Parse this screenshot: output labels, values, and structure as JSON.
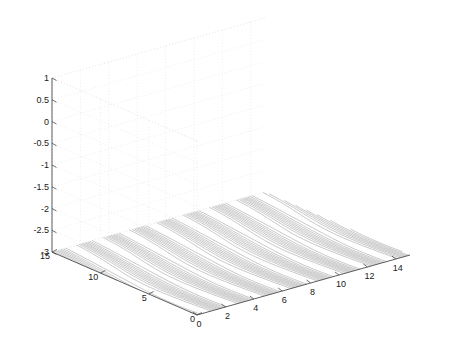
{
  "figure": {
    "background_color": "#ffffff",
    "renderer": "matlab-meshc-3d-surface",
    "width": 455,
    "height": 361
  },
  "chart_data": {
    "type": "surface",
    "title": "",
    "subtitle": "",
    "xlabel": "",
    "ylabel": "",
    "zlabel": "",
    "grid": true,
    "grid_style": "dotted",
    "legend": null,
    "legend_position": "none",
    "projection": "3d-perspective",
    "mesh_style": "wireframe-diamond",
    "mesh_color": "#3a3a3a",
    "contour_color": "#9a9a9a",
    "axis_color": "#4d4d4d",
    "gridline_color": "#e2e2e2",
    "has_base_contour": true,
    "x": {
      "label": "",
      "ticks": [
        0,
        2,
        4,
        6,
        8,
        10,
        12,
        14
      ],
      "ticklabels": [
        "0",
        "2",
        "4",
        "6",
        "8",
        "10",
        "12",
        "14"
      ],
      "lim": [
        0,
        15
      ]
    },
    "y": {
      "label": "",
      "ticks": [
        0,
        5,
        10,
        15
      ],
      "ticklabels": [
        "0",
        "5",
        "10",
        "15"
      ],
      "lim": [
        0,
        15
      ]
    },
    "z": {
      "label": "",
      "ticks": [
        1,
        0.5,
        0,
        -0.5,
        -1,
        -1.5,
        -2,
        -2.5,
        -3
      ],
      "ticklabels": [
        "1",
        "0.5",
        "0",
        "-0.5",
        "-1",
        "-1.5",
        "-2",
        "-2.5",
        "-3"
      ],
      "lim": [
        -3,
        1
      ]
    },
    "surface": {
      "description": "Oscillating sinusoidal wave train along x with narrow ridge profile along y",
      "formula_hint": "z = sin(x) envelope across y",
      "x_periods": 4,
      "amplitude": 1.0,
      "z_offset": 0.0,
      "n_x_samples": 120,
      "n_y_samples": 46
    },
    "contour_levels": [
      -0.8,
      -0.6,
      -0.4,
      -0.2,
      0,
      0.2,
      0.4,
      0.6,
      0.8
    ],
    "contour_plane_z": -3
  },
  "axes_geometry": {
    "origin_front": {
      "x": 197,
      "y": 315
    },
    "corner_left": {
      "x": 52,
      "y": 252
    },
    "corner_right": {
      "x": 410,
      "y": 255
    },
    "corner_back": {
      "x": 255,
      "y": 192
    },
    "z_top_left": {
      "x": 52,
      "y": 78
    },
    "z_height_px": 174
  }
}
